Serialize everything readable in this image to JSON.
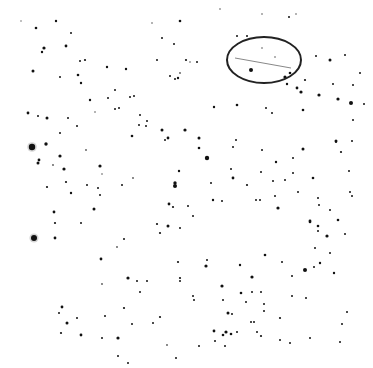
{
  "image": {
    "kind": "star-field-negative",
    "width": 373,
    "height": 368,
    "background": "#ffffff",
    "star_color": "#111111"
  },
  "annotation": {
    "type": "ellipse",
    "cx": 264,
    "cy": 60,
    "rx": 37,
    "ry": 23,
    "stroke": "#222222",
    "stroke_width": 2,
    "line": {
      "x1": 235,
      "y1": 58,
      "x2": 291,
      "y2": 68,
      "stroke": "#888888"
    }
  },
  "stars": [
    [
      21,
      21,
      0.7
    ],
    [
      56,
      21,
      1.2
    ],
    [
      36,
      28,
      1.3
    ],
    [
      71,
      33,
      1.0
    ],
    [
      66,
      46,
      1.4
    ],
    [
      44,
      48,
      1.6
    ],
    [
      42,
      52,
      1.2
    ],
    [
      33,
      71,
      1.5
    ],
    [
      60,
      77,
      1.0
    ],
    [
      85,
      60,
      1.1
    ],
    [
      80,
      61,
      1.0
    ],
    [
      78,
      75,
      1.3
    ],
    [
      81,
      83,
      1.2
    ],
    [
      107,
      67,
      1.2
    ],
    [
      180,
      21,
      1.3
    ],
    [
      152,
      23,
      0.8
    ],
    [
      162,
      38,
      1.0
    ],
    [
      170,
      76,
      1.0
    ],
    [
      175,
      79,
      1.0
    ],
    [
      178,
      78,
      1.2
    ],
    [
      157,
      60,
      1.0
    ],
    [
      190,
      62,
      0.8
    ],
    [
      180,
      73,
      0.9
    ],
    [
      174,
      44,
      1.0
    ],
    [
      28,
      113,
      1.4
    ],
    [
      38,
      116,
      1.0
    ],
    [
      47,
      118,
      1.5
    ],
    [
      60,
      133,
      1.0
    ],
    [
      68,
      118,
      1.0
    ],
    [
      115,
      109,
      1.0
    ],
    [
      108,
      98,
      1.0
    ],
    [
      119,
      108,
      1.0
    ],
    [
      130,
      97,
      1.0
    ],
    [
      132,
      136,
      1.3
    ],
    [
      162,
      130,
      1.5
    ],
    [
      185,
      130,
      1.6
    ],
    [
      165,
      140,
      1.0
    ],
    [
      77,
      126,
      1.0
    ],
    [
      32,
      147,
      3.2
    ],
    [
      46,
      144,
      1.7
    ],
    [
      60,
      156,
      1.6
    ],
    [
      38,
      163,
      1.5
    ],
    [
      39,
      160,
      1.4
    ],
    [
      53,
      165,
      0.9
    ],
    [
      64,
      169,
      1.6
    ],
    [
      100,
      166,
      1.6
    ],
    [
      66,
      182,
      1.1
    ],
    [
      86,
      150,
      0.9
    ],
    [
      87,
      185,
      1.0
    ],
    [
      102,
      174,
      0.8
    ],
    [
      133,
      178,
      0.9
    ],
    [
      122,
      185,
      1.0
    ],
    [
      175,
      183,
      1.7
    ],
    [
      179,
      171,
      1.2
    ],
    [
      168,
      138,
      1.4
    ],
    [
      207,
      158,
      2.2
    ],
    [
      199,
      138,
      1.5
    ],
    [
      199,
      148,
      1.3
    ],
    [
      186,
      60,
      1.1
    ],
    [
      197,
      62,
      1.0
    ],
    [
      214,
      107,
      1.2
    ],
    [
      237,
      105,
      1.3
    ],
    [
      272,
      113,
      1.0
    ],
    [
      303,
      110,
      1.3
    ],
    [
      319,
      95,
      1.6
    ],
    [
      338,
      99,
      1.6
    ],
    [
      351,
      103,
      2.0
    ],
    [
      303,
      149,
      1.5
    ],
    [
      336,
      141,
      1.5
    ],
    [
      341,
      152,
      1.1
    ],
    [
      293,
      158,
      1.0
    ],
    [
      276,
      162,
      1.2
    ],
    [
      233,
      178,
      1.4
    ],
    [
      261,
      172,
      1.0
    ],
    [
      260,
      200,
      1.0
    ],
    [
      275,
      196,
      1.0
    ],
    [
      256,
      200,
      1.0
    ],
    [
      247,
      185,
      1.1
    ],
    [
      188,
      206,
      1.0
    ],
    [
      193,
      216,
      1.0
    ],
    [
      213,
      200,
      1.2
    ],
    [
      222,
      201,
      1.0
    ],
    [
      330,
      210,
      1.0
    ],
    [
      352,
      141,
      1.0
    ],
    [
      349,
      171,
      1.0
    ],
    [
      318,
      198,
      1.0
    ],
    [
      319,
      205,
      1.0
    ],
    [
      211,
      183,
      1.0
    ],
    [
      318,
      226,
      1.3
    ],
    [
      318,
      231,
      1.0
    ],
    [
      315,
      248,
      1.0
    ],
    [
      327,
      236,
      1.6
    ],
    [
      310,
      221,
      1.4
    ],
    [
      278,
      208,
      1.6
    ],
    [
      310,
      222,
      1.3
    ],
    [
      338,
      220,
      1.3
    ],
    [
      345,
      234,
      1.0
    ],
    [
      285,
      180,
      1.0
    ],
    [
      47,
      187,
      1.1
    ],
    [
      71,
      193,
      1.2
    ],
    [
      98,
      188,
      1.0
    ],
    [
      100,
      195,
      1.0
    ],
    [
      54,
      212,
      1.4
    ],
    [
      55,
      223,
      1.1
    ],
    [
      81,
      223,
      1.0
    ],
    [
      94,
      209,
      1.5
    ],
    [
      55,
      238,
      1.4
    ],
    [
      34,
      238,
      3.0
    ],
    [
      101,
      259,
      1.4
    ],
    [
      117,
      247,
      0.9
    ],
    [
      124,
      239,
      1.0
    ],
    [
      160,
      233,
      1.1
    ],
    [
      175,
      186,
      2.0
    ],
    [
      169,
      204,
      1.4
    ],
    [
      173,
      207,
      1.1
    ],
    [
      157,
      224,
      1.1
    ],
    [
      180,
      228,
      1.0
    ],
    [
      168,
      226,
      1.5
    ],
    [
      180,
      278,
      1.1
    ],
    [
      178,
      262,
      1.1
    ],
    [
      147,
      281,
      1.0
    ],
    [
      128,
      278,
      1.6
    ],
    [
      137,
      281,
      1.0
    ],
    [
      102,
      284,
      0.9
    ],
    [
      124,
      308,
      1.1
    ],
    [
      140,
      292,
      1.0
    ],
    [
      105,
      316,
      1.0
    ],
    [
      62,
      307,
      1.4
    ],
    [
      59,
      313,
      1.0
    ],
    [
      67,
      323,
      1.5
    ],
    [
      77,
      318,
      1.0
    ],
    [
      61,
      333,
      1.1
    ],
    [
      81,
      335,
      1.4
    ],
    [
      118,
      338,
      1.6
    ],
    [
      132,
      324,
      1.0
    ],
    [
      102,
      338,
      1.0
    ],
    [
      153,
      323,
      1.0
    ],
    [
      176,
      358,
      1.0
    ],
    [
      128,
      363,
      1.0
    ],
    [
      167,
      345,
      0.9
    ],
    [
      160,
      317,
      1.1
    ],
    [
      118,
      356,
      1.0
    ],
    [
      180,
      281,
      1.0
    ],
    [
      193,
      296,
      1.0
    ],
    [
      194,
      300,
      1.0
    ],
    [
      206,
      266,
      1.6
    ],
    [
      207,
      260,
      1.0
    ],
    [
      222,
      286,
      1.6
    ],
    [
      240,
      265,
      1.2
    ],
    [
      241,
      293,
      1.3
    ],
    [
      246,
      302,
      1.0
    ],
    [
      228,
      313,
      1.5
    ],
    [
      226,
      332,
      1.6
    ],
    [
      214,
      331,
      1.4
    ],
    [
      223,
      335,
      1.3
    ],
    [
      231,
      334,
      1.3
    ],
    [
      225,
      346,
      1.0
    ],
    [
      215,
      341,
      1.0
    ],
    [
      232,
      314,
      1.0
    ],
    [
      223,
      300,
      1.0
    ],
    [
      199,
      346,
      1.0
    ],
    [
      237,
      332,
      1.0
    ],
    [
      257,
      332,
      1.0
    ],
    [
      261,
      336,
      1.1
    ],
    [
      254,
      322,
      1.0
    ],
    [
      264,
      311,
      1.0
    ],
    [
      280,
      318,
      1.1
    ],
    [
      292,
      296,
      1.0
    ],
    [
      305,
      270,
      2.0
    ],
    [
      306,
      298,
      1.0
    ],
    [
      292,
      276,
      1.0
    ],
    [
      314,
      267,
      1.0
    ],
    [
      334,
      273,
      1.2
    ],
    [
      347,
      312,
      1.0
    ],
    [
      342,
      324,
      1.0
    ],
    [
      252,
      277,
      1.6
    ],
    [
      252,
      292,
      1.0
    ],
    [
      261,
      292,
      1.0
    ],
    [
      264,
      304,
      1.0
    ],
    [
      310,
      338,
      1.0
    ],
    [
      290,
      343,
      1.0
    ],
    [
      340,
      342,
      1.0
    ],
    [
      251,
      322,
      1.0
    ],
    [
      280,
      340,
      1.0
    ],
    [
      265,
      255,
      1.3
    ],
    [
      282,
      262,
      1.0
    ],
    [
      320,
      263,
      1.2
    ],
    [
      330,
      253,
      1.0
    ],
    [
      220,
      9,
      0.8
    ],
    [
      262,
      14,
      0.8
    ],
    [
      237,
      36,
      1.0
    ],
    [
      247,
      36,
      1.0
    ],
    [
      289,
      17,
      1.0
    ],
    [
      296,
      14,
      0.8
    ],
    [
      251,
      70,
      2.0
    ],
    [
      285,
      77,
      1.6
    ],
    [
      290,
      73,
      1.3
    ],
    [
      301,
      92,
      1.6
    ],
    [
      297,
      88,
      1.4
    ],
    [
      287,
      84,
      1.2
    ],
    [
      305,
      80,
      1.1
    ],
    [
      330,
      60,
      1.5
    ],
    [
      316,
      56,
      1.0
    ],
    [
      333,
      84,
      1.0
    ],
    [
      262,
      48,
      0.8
    ],
    [
      275,
      57,
      0.8
    ],
    [
      266,
      108,
      1.0
    ],
    [
      353,
      85,
      1.0
    ],
    [
      360,
      73,
      1.0
    ],
    [
      345,
      55,
      1.0
    ],
    [
      353,
      120,
      1.0
    ],
    [
      364,
      104,
      1.0
    ],
    [
      336,
      142,
      1.0
    ],
    [
      350,
      192,
      1.0
    ],
    [
      352,
      196,
      1.0
    ],
    [
      313,
      178,
      1.3
    ],
    [
      273,
      181,
      1.0
    ],
    [
      236,
      140,
      1.0
    ],
    [
      231,
      169,
      1.0
    ],
    [
      233,
      147,
      1.0
    ],
    [
      262,
      150,
      1.0
    ],
    [
      293,
      173,
      1.0
    ],
    [
      298,
      192,
      1.0
    ],
    [
      90,
      100,
      1.2
    ],
    [
      95,
      112,
      0.8
    ],
    [
      115,
      90,
      1.0
    ],
    [
      140,
      115,
      1.0
    ],
    [
      147,
      121,
      1.0
    ],
    [
      146,
      126,
      1.0
    ],
    [
      126,
      69,
      1.2
    ],
    [
      134,
      96,
      1.0
    ],
    [
      139,
      125,
      1.0
    ]
  ]
}
